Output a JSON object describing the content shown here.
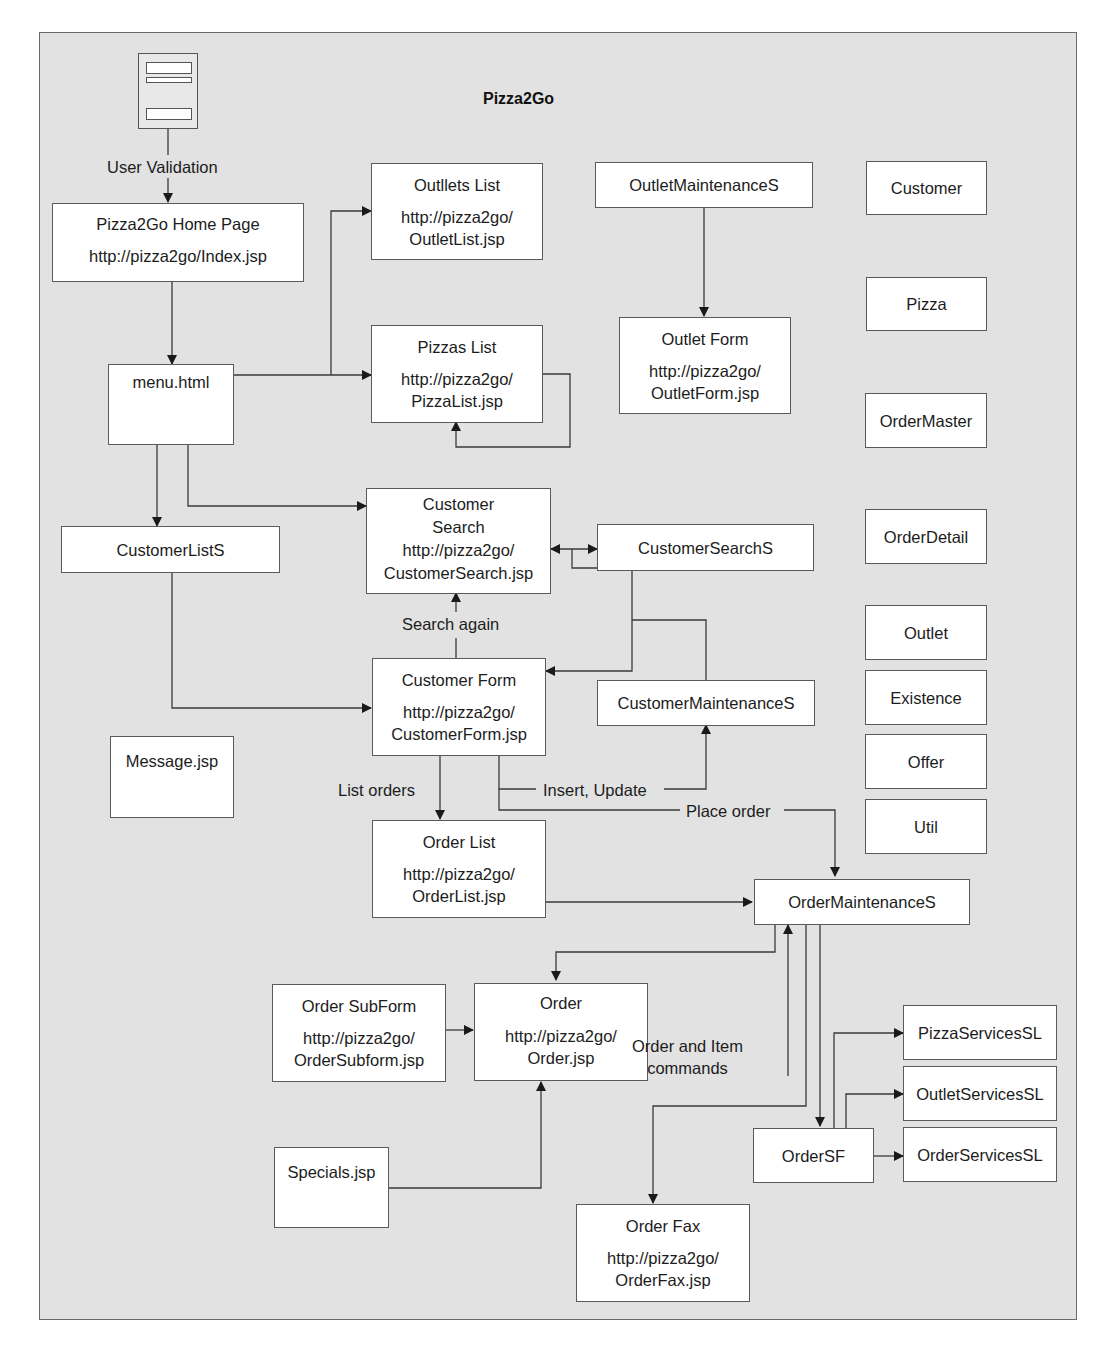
{
  "diagram": {
    "title": "Pizza2Go",
    "nodes": {
      "home": {
        "title": "Pizza2Go Home Page",
        "url": "http://pizza2go/Index.jsp"
      },
      "outlets_list": {
        "title": "Outllets List",
        "url1": "http://pizza2go/",
        "url2": "OutletList.jsp"
      },
      "outlet_maint": {
        "title": "OutletMaintenanceS"
      },
      "outlet_form": {
        "title": "Outlet Form",
        "url1": "http://pizza2go/",
        "url2": "OutletForm.jsp"
      },
      "menu": {
        "title": "menu.html"
      },
      "pizzas_list": {
        "title": "Pizzas List",
        "url1": "http://pizza2go/",
        "url2": "PizzaList.jsp"
      },
      "customer_list_s": {
        "title": "CustomerListS"
      },
      "customer_search": {
        "title1": "Customer",
        "title2": "Search",
        "url1": "http://pizza2go/",
        "url2": "CustomerSearch.jsp"
      },
      "customer_search_s": {
        "title": "CustomerSearchS"
      },
      "customer_form": {
        "title": "Customer Form",
        "url1": "http://pizza2go/",
        "url2": "CustomerForm.jsp"
      },
      "customer_maint": {
        "title": "CustomerMaintenanceS"
      },
      "message": {
        "title": "Message.jsp"
      },
      "order_list": {
        "title": "Order List",
        "url1": "http://pizza2go/",
        "url2": "OrderList.jsp"
      },
      "order_maint": {
        "title": "OrderMaintenanceS"
      },
      "order_subform": {
        "title": "Order SubForm",
        "url1": "http://pizza2go/",
        "url2": "OrderSubform.jsp"
      },
      "order": {
        "title": "Order",
        "url1": "http://pizza2go/",
        "url2": "Order.jsp"
      },
      "specials": {
        "title": "Specials.jsp"
      },
      "order_fax": {
        "title": "Order Fax",
        "url1": "http://pizza2go/",
        "url2": "OrderFax.jsp"
      },
      "order_sf": {
        "title": "OrderSF"
      },
      "pizza_services": {
        "title": "PizzaServicesSL"
      },
      "outlet_services": {
        "title": "OutletServicesSL"
      },
      "order_services": {
        "title": "OrderServicesSL"
      }
    },
    "entities": [
      "Customer",
      "Pizza",
      "OrderMaster",
      "OrderDetail",
      "Outlet",
      "Existence",
      "Offer",
      "Util"
    ],
    "edge_labels": {
      "user_validation": "User Validation",
      "search_again": "Search again",
      "list_orders": "List orders",
      "insert_update": "Insert, Update",
      "place_order": "Place order",
      "order_item_cmds_1": "Order and Item",
      "order_item_cmds_2": "commands"
    },
    "colors": {
      "background": "#e2e2e2",
      "box_fill": "#ffffff",
      "line": "#3a3a3a"
    }
  }
}
